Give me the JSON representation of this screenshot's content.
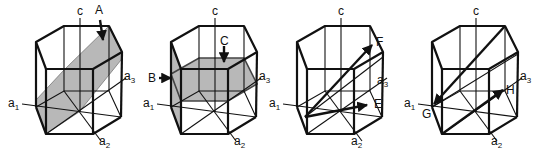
{
  "figure": {
    "shade_color": "#b8b8b8",
    "line_color": "#111111",
    "panels": [
      {
        "id": "panel-1",
        "axis_labels": {
          "c": "c",
          "a1": "a",
          "a1_sub": "1",
          "a2": "a",
          "a2_sub": "2",
          "a3": "a",
          "a3_sub": "3"
        },
        "features": [
          {
            "label": "A",
            "kind": "plane"
          }
        ]
      },
      {
        "id": "panel-2",
        "axis_labels": {
          "c": "c",
          "a1": "a",
          "a1_sub": "1",
          "a2": "a",
          "a2_sub": "2",
          "a3": "a",
          "a3_sub": "3"
        },
        "features": [
          {
            "label": "B",
            "kind": "plane"
          },
          {
            "label": "C",
            "kind": "plane"
          }
        ]
      },
      {
        "id": "panel-3",
        "axis_labels": {
          "c": "c",
          "a1": "a",
          "a1_sub": "1",
          "a2": "a",
          "a2_sub": "2",
          "a3": "a",
          "a3_sub": "3"
        },
        "features": [
          {
            "label": "F",
            "kind": "direction"
          },
          {
            "label": "E",
            "kind": "direction"
          }
        ]
      },
      {
        "id": "panel-4",
        "axis_labels": {
          "c": "c",
          "a1": "a",
          "a1_sub": "1",
          "a2": "a",
          "a2_sub": "2",
          "a3": "a",
          "a3_sub": "3"
        },
        "features": [
          {
            "label": "G",
            "kind": "direction"
          },
          {
            "label": "H",
            "kind": "direction"
          }
        ]
      }
    ]
  }
}
